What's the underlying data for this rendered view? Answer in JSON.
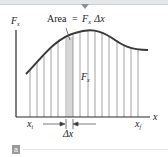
{
  "figure": {
    "annotation": "Area = FₓΔx",
    "annotation_parts": {
      "prefix": "Area",
      "equals": "=",
      "F": "F",
      "F_sub": "x",
      "delta_x": "Δx"
    },
    "y_axis_label": {
      "main": "F",
      "sub": "x"
    },
    "x_axis_label": "x",
    "inner_label": {
      "main": "F",
      "sub": "x"
    },
    "x_start_label": {
      "main": "x",
      "sub": "i"
    },
    "x_end_label": {
      "main": "x",
      "sub": "f"
    },
    "delta_label": "Δx",
    "badge": "a",
    "colors": {
      "curve": "#3a3a3a",
      "grid": "#8a8a8a",
      "highlight": "#d0d0d0",
      "axis": "#2a2a2a",
      "badge_bg": "#9a9a9a"
    }
  }
}
